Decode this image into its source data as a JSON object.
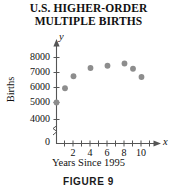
{
  "figure": {
    "title_line1": "U.S. HIGHER-ORDER",
    "title_line2": "MULTIPLE BIRTHS",
    "caption": "FIGURE 9",
    "x_axis_letter": "x",
    "y_axis_letter": "y",
    "dot_color": "#8d8d8d",
    "axis_color": "#555555"
  },
  "chart_data": {
    "type": "scatter",
    "title": "U.S. HIGHER-ORDER MULTIPLE BIRTHS",
    "xlabel": "Years Since 1995",
    "ylabel": "Births",
    "xlim": [
      0,
      11.6
    ],
    "ylim": [
      3500,
      8400
    ],
    "y_axis_break": true,
    "y_break_between": [
      0,
      4000
    ],
    "grid": false,
    "legend": null,
    "xticks": [
      1,
      2,
      3,
      4,
      5,
      6,
      7,
      8,
      9,
      10,
      11
    ],
    "xtick_labels": [
      "2",
      "4",
      "6",
      "8",
      "10"
    ],
    "xtick_labeled_values": [
      2,
      4,
      6,
      8,
      10
    ],
    "yticks": [
      0,
      4000,
      5000,
      6000,
      7000,
      8000
    ],
    "ytick_labels": [
      "0",
      "4000",
      "5000",
      "6000",
      "7000",
      "8000"
    ],
    "x": [
      0,
      1,
      2,
      4,
      6,
      8,
      9,
      10
    ],
    "y": [
      5000,
      5950,
      6750,
      7300,
      7450,
      7600,
      7250,
      6700
    ],
    "points": [
      {
        "x": 0,
        "y": 5000
      },
      {
        "x": 1,
        "y": 5950
      },
      {
        "x": 2,
        "y": 6750
      },
      {
        "x": 4,
        "y": 7300
      },
      {
        "x": 6,
        "y": 7450
      },
      {
        "x": 8,
        "y": 7600
      },
      {
        "x": 9,
        "y": 7250
      },
      {
        "x": 10,
        "y": 6700
      }
    ]
  }
}
